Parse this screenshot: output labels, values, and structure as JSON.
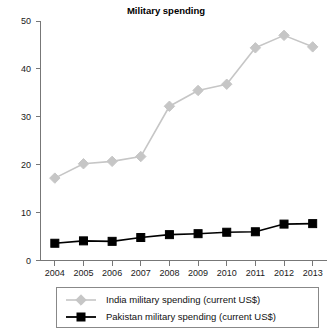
{
  "chart_data": {
    "type": "line",
    "title": "Military spending",
    "xlabel": "",
    "ylabel": "",
    "categories": [
      "2004",
      "2005",
      "2006",
      "2007",
      "2008",
      "2009",
      "2010",
      "2011",
      "2012",
      "2013"
    ],
    "x": [
      2004,
      2005,
      2006,
      2007,
      2008,
      2009,
      2010,
      2011,
      2012,
      2013
    ],
    "ylim": [
      0,
      50
    ],
    "yticks": [
      0,
      10,
      20,
      30,
      40,
      50
    ],
    "grid": false,
    "legend_position": "bottom",
    "series": [
      {
        "name": "India military spending (current US$)",
        "color": "#c6c6c6",
        "marker": "diamond",
        "values": [
          17.2,
          20.2,
          20.7,
          21.7,
          32.2,
          35.5,
          36.8,
          44.4,
          47.0,
          44.6
        ]
      },
      {
        "name": "Pakistan military spending (current US$)",
        "color": "#000000",
        "marker": "square",
        "values": [
          3.6,
          4.1,
          4.0,
          4.8,
          5.4,
          5.6,
          5.9,
          6.0,
          7.6,
          7.7
        ]
      }
    ]
  },
  "legend": {
    "entries": [
      {
        "label": "India military spending (current US$)"
      },
      {
        "label": "Pakistan military spending (current US$)"
      }
    ]
  }
}
